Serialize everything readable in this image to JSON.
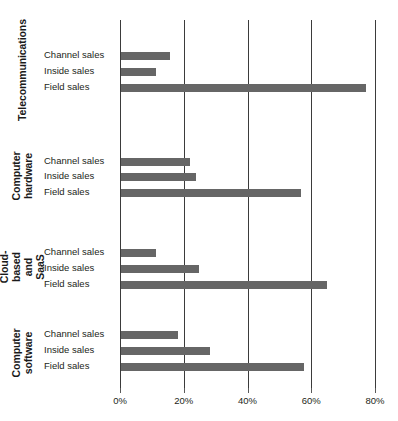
{
  "chart_data": {
    "type": "bar",
    "orientation": "horizontal",
    "title": "",
    "subtitle": "",
    "xlabel": "",
    "ylabel": "",
    "xlim": [
      0,
      80
    ],
    "xticks": [
      0,
      20,
      40,
      60,
      80
    ],
    "xtick_labels": [
      "0%",
      "20%",
      "40%",
      "60%",
      "80%"
    ],
    "grid": "vertical",
    "legend": "none",
    "bar_color": "#666666",
    "axis_color": "#3b3b3b",
    "categories": [
      "Telecommunications",
      "Computer hardware",
      "Cloud-based and SaaS",
      "Computer software"
    ],
    "series_names": [
      "Channel sales",
      "Inside sales",
      "Field sales"
    ],
    "groups": [
      {
        "category": "Telecommunications",
        "category_lines": [
          "Telecommunications"
        ],
        "bars": [
          {
            "label": "Channel sales",
            "value": 15.5
          },
          {
            "label": "Inside sales",
            "value": 11
          },
          {
            "label": "Field sales",
            "value": 77
          }
        ]
      },
      {
        "category": "Computer hardware",
        "category_lines": [
          "Computer",
          "hardware"
        ],
        "bars": [
          {
            "label": "Channel sales",
            "value": 21.5
          },
          {
            "label": "Inside sales",
            "value": 23.5
          },
          {
            "label": "Field sales",
            "value": 56.5
          }
        ]
      },
      {
        "category": "Cloud-based and SaaS",
        "category_lines": [
          "Cloud-based",
          "and SaaS"
        ],
        "bars": [
          {
            "label": "Channel sales",
            "value": 11
          },
          {
            "label": "Inside sales",
            "value": 24.5
          },
          {
            "label": "Field sales",
            "value": 64.5
          }
        ]
      },
      {
        "category": "Computer software",
        "category_lines": [
          "Computer",
          "software"
        ],
        "bars": [
          {
            "label": "Channel sales",
            "value": 18
          },
          {
            "label": "Inside sales",
            "value": 28
          },
          {
            "label": "Field sales",
            "value": 57.5
          }
        ]
      }
    ]
  },
  "layout": {
    "plot_left": 120,
    "plot_top": 20,
    "plot_width": 255,
    "plot_height": 368,
    "px_per_percent": 3.1875,
    "group_tops": [
      40,
      146,
      241,
      327
    ],
    "bar_rows_y": [
      [
        52,
        68,
        84
      ],
      [
        158,
        173,
        189
      ],
      [
        249,
        265,
        281
      ],
      [
        331,
        347,
        363
      ]
    ],
    "group_label_boxes": [
      {
        "top": 10,
        "height": 120,
        "two_line": false
      },
      {
        "top": 136,
        "height": 78,
        "two_line": true
      },
      {
        "top": 228,
        "height": 76,
        "two_line": true
      },
      {
        "top": 314,
        "height": 76,
        "two_line": true
      }
    ]
  }
}
